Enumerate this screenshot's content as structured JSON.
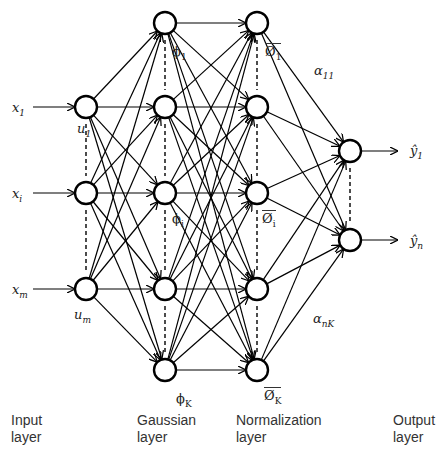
{
  "diagram": {
    "type": "neural-network",
    "layers": [
      {
        "id": "input",
        "label_line1": "Input",
        "label_line2": "layer",
        "nodes": [
          {
            "id": "u1",
            "label": "u",
            "sub": "1",
            "x": 86,
            "y": 107
          },
          {
            "id": "ui",
            "label": "",
            "sub": "",
            "x": 86,
            "y": 193
          },
          {
            "id": "um",
            "label": "u",
            "sub": "m",
            "x": 86,
            "y": 289
          }
        ]
      },
      {
        "id": "gaussian",
        "label_line1": "Gaussian",
        "label_line2": "layer",
        "nodes": [
          {
            "id": "phi1",
            "label": "φ",
            "sub": "1",
            "x": 165,
            "y": 23
          },
          {
            "id": "phi2",
            "x": 165,
            "y": 107
          },
          {
            "id": "phii",
            "label": "φ",
            "sub": "i",
            "x": 165,
            "y": 193
          },
          {
            "id": "phi4",
            "x": 165,
            "y": 289
          },
          {
            "id": "phiK",
            "label": "φ",
            "sub": "K",
            "x": 165,
            "y": 370
          }
        ]
      },
      {
        "id": "normalization",
        "label_line1": "Normalization",
        "label_line2": "layer",
        "nodes": [
          {
            "id": "n1",
            "label": "Ø",
            "sub": "1",
            "x": 257,
            "y": 23
          },
          {
            "id": "n2",
            "x": 257,
            "y": 107
          },
          {
            "id": "ni",
            "label": "Ø",
            "sub": "i",
            "x": 257,
            "y": 193
          },
          {
            "id": "n4",
            "x": 257,
            "y": 289
          },
          {
            "id": "nK",
            "label": "Ø",
            "sub": "K",
            "x": 257,
            "y": 370
          }
        ]
      },
      {
        "id": "output",
        "label_line1": "Output",
        "label_line2": "layer",
        "nodes": [
          {
            "id": "y1",
            "x": 350,
            "y": 151
          },
          {
            "id": "yn",
            "x": 350,
            "y": 240
          }
        ]
      }
    ],
    "inputs": [
      {
        "label": "x",
        "sub": "1",
        "y": 107
      },
      {
        "label": "x",
        "sub": "i",
        "y": 193
      },
      {
        "label": "x",
        "sub": "m",
        "y": 289
      }
    ],
    "outputs": [
      {
        "label": "ŷ",
        "sub": "1",
        "y": 151
      },
      {
        "label": "ŷ",
        "sub": "n",
        "y": 240
      }
    ],
    "weights": {
      "top": {
        "label": "α",
        "sub": "11"
      },
      "bottom": {
        "label": "α",
        "sub": "nK"
      }
    },
    "labels": {
      "x1": "x",
      "x1_sub": "1",
      "xi": "x",
      "xi_sub": "i",
      "xm": "x",
      "xm_sub": "m",
      "u1": "u",
      "u1_sub": "1",
      "um": "u",
      "um_sub": "m",
      "phi1": "ϕ",
      "phi1_sub": "1",
      "phii": "ϕ",
      "phii_sub": "i",
      "phiK": "ϕ",
      "phiK_sub": "K",
      "n1": "Ø",
      "n1_sub": "1",
      "ni": "Ø",
      "ni_sub": "i",
      "nK": "Ø",
      "nK_sub": "K",
      "a11": "α",
      "a11_sub": "11",
      "anK": "α",
      "anK_sub": "nK",
      "y1": "ŷ",
      "y1_sub": "1",
      "yn": "ŷ",
      "yn_sub": "n"
    },
    "layer_labels": {
      "input": [
        "Input",
        "layer"
      ],
      "gaussian": [
        "Gaussian",
        "layer"
      ],
      "normalization": [
        "Normalization",
        "layer"
      ],
      "output": [
        "Output",
        "layer"
      ]
    },
    "colors": {
      "stroke": "#000000",
      "text": "#222222",
      "caption": "#cccccc"
    }
  }
}
